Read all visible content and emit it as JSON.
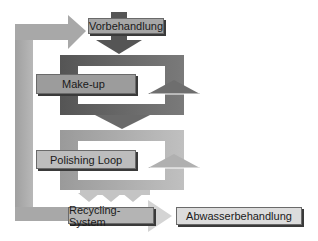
{
  "diagram": {
    "nodes": [
      {
        "id": "vorbehandlung",
        "label": "Vorbehandlung"
      },
      {
        "id": "make_up",
        "label": "Make-up"
      },
      {
        "id": "polishing_loop",
        "label": "Polishing Loop"
      },
      {
        "id": "recycling_system",
        "label": "Recycling-System"
      },
      {
        "id": "abwasserbehandlung",
        "label": "Abwasserbehandlung"
      }
    ],
    "edges": [
      {
        "from": "vorbehandlung",
        "to": "make_up"
      },
      {
        "from": "make_up",
        "to": "polishing_loop"
      },
      {
        "from": "polishing_loop",
        "to": "recycling_system"
      },
      {
        "from": "recycling_system",
        "to": "vorbehandlung",
        "label": "return"
      },
      {
        "from": "recycling_system",
        "to": "abwasserbehandlung"
      }
    ],
    "colors": {
      "dark": "#5e5e5e",
      "medium": "#7c7c7c",
      "light": "#a9a9a9",
      "pale": "#cfcfcf",
      "label_fill_dark": "#9a9a9a",
      "label_fill_light": "#bdbdbd"
    }
  }
}
